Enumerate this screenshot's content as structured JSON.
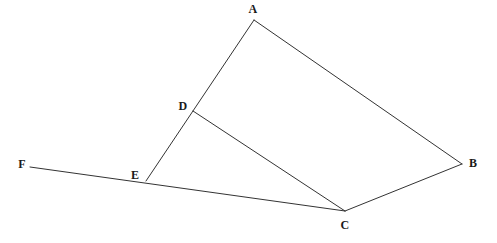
{
  "figure": {
    "type": "geometry-diagram",
    "width": 497,
    "height": 243,
    "background_color": "#ffffff",
    "stroke_color": "#333333",
    "stroke_width": 1,
    "label_color": "#1a1a1a"
  },
  "points": [
    {
      "id": "A",
      "label": "A",
      "x": 254,
      "y": 20,
      "label_x": 253,
      "label_y": 9,
      "role": "quadrilateral-vertex"
    },
    {
      "id": "B",
      "label": "B",
      "x": 462,
      "y": 164,
      "label_x": 473,
      "label_y": 163,
      "role": "quadrilateral-vertex"
    },
    {
      "id": "C",
      "label": "C",
      "x": 345,
      "y": 211,
      "label_x": 345,
      "label_y": 225,
      "role": "quadrilateral-vertex"
    },
    {
      "id": "D",
      "label": "D",
      "x": 193,
      "y": 111,
      "label_x": 183,
      "label_y": 106,
      "role": "point-on-segment-AE"
    },
    {
      "id": "E",
      "label": "E",
      "x": 146,
      "y": 181,
      "label_x": 135,
      "label_y": 175,
      "role": "point-on-segment-FC"
    },
    {
      "id": "F",
      "label": "F",
      "x": 30,
      "y": 167,
      "label_x": 22,
      "label_y": 164,
      "role": "ray-endpoint"
    }
  ],
  "segments": [
    {
      "id": "AE",
      "from": "A",
      "to": "E",
      "x1": 254,
      "y1": 20,
      "x2": 146,
      "y2": 181,
      "passes_through": "D"
    },
    {
      "id": "AB",
      "from": "A",
      "to": "B",
      "x1": 254,
      "y1": 20,
      "x2": 462,
      "y2": 164,
      "passes_through": null
    },
    {
      "id": "BC",
      "from": "B",
      "to": "C",
      "x1": 462,
      "y1": 164,
      "x2": 345,
      "y2": 211,
      "passes_through": null
    },
    {
      "id": "DC",
      "from": "D",
      "to": "C",
      "x1": 193,
      "y1": 111,
      "x2": 345,
      "y2": 211,
      "passes_through": null
    },
    {
      "id": "FC",
      "from": "F",
      "to": "C",
      "x1": 30,
      "y1": 167,
      "x2": 345,
      "y2": 211,
      "passes_through": "E"
    }
  ]
}
